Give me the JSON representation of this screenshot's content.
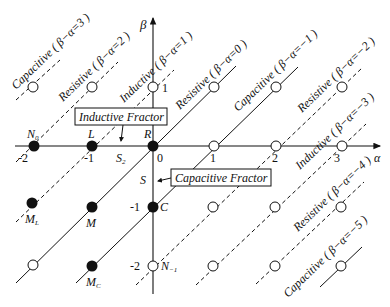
{
  "diagram": {
    "axes": {
      "x_label": "α",
      "y_label": "β",
      "x_ticks": [
        "-2",
        "-1",
        "0",
        "1",
        "2",
        "3"
      ],
      "y_ticks": [
        "1",
        "0",
        "-1",
        "-2"
      ]
    },
    "point_labels": {
      "N0": "N",
      "N0_sub": "0",
      "L": "L",
      "R": "R",
      "S2": "S",
      "S2_sub": "2",
      "S": "S",
      "C": "C",
      "ML": "M",
      "ML_sub": "L",
      "M": "M",
      "MC": "M",
      "MC_sub": "C",
      "Nm1": "N",
      "Nm1_sub": "−1"
    },
    "boxes": {
      "inductive": "Inductive Fractor",
      "capacitive": "Capacitive Fractor"
    },
    "line_labels": [
      {
        "text": "Capacitive ( β−α=3 )",
        "style": "dashed"
      },
      {
        "text": "Resistive ( β−α=2 )",
        "style": "dashed"
      },
      {
        "text": "Inductive ( β−α=1 )",
        "style": "dashed"
      },
      {
        "text": "Resistive ( β−α=0 )",
        "style": "solid"
      },
      {
        "text": "Capacitive ( β−α=−1 )",
        "style": "solid"
      },
      {
        "text": "Resistive ( β−α=−2 )",
        "style": "dashed"
      },
      {
        "text": "Inductive ( β−α=−3 )",
        "style": "dashed"
      },
      {
        "text": "Resistive ( β−α=−4 )",
        "style": "dashed"
      },
      {
        "text": "Capacitive ( β−α=−5 )",
        "style": "solid"
      }
    ],
    "filled_points": [
      {
        "name": "N0",
        "alpha": -2,
        "beta": 0
      },
      {
        "name": "L",
        "alpha": -1,
        "beta": 0
      },
      {
        "name": "R",
        "alpha": 0,
        "beta": 0
      },
      {
        "name": "ML",
        "alpha": -2,
        "beta": -1
      },
      {
        "name": "M",
        "alpha": -1,
        "beta": -1
      },
      {
        "name": "C",
        "alpha": 0,
        "beta": -1
      },
      {
        "name": "MC",
        "alpha": -1,
        "beta": -2
      }
    ],
    "open_points": [
      {
        "alpha": -2,
        "beta": 1
      },
      {
        "alpha": -1,
        "beta": 1
      },
      {
        "alpha": 0,
        "beta": 1
      },
      {
        "alpha": 1,
        "beta": 1
      },
      {
        "alpha": 2,
        "beta": 1
      },
      {
        "alpha": 3,
        "beta": 1
      },
      {
        "alpha": 1,
        "beta": 0
      },
      {
        "alpha": 2,
        "beta": 0
      },
      {
        "alpha": 3,
        "beta": 0
      },
      {
        "alpha": 1,
        "beta": -1
      },
      {
        "alpha": 2,
        "beta": -1
      },
      {
        "alpha": 3,
        "beta": -1
      },
      {
        "alpha": -2,
        "beta": -2
      },
      {
        "alpha": 0,
        "beta": -2,
        "name": "N-1"
      },
      {
        "alpha": 1,
        "beta": -2
      },
      {
        "alpha": 2,
        "beta": -2
      },
      {
        "alpha": 3,
        "beta": -2
      }
    ],
    "colors": {
      "ink": "#111111",
      "background": "#ffffff"
    }
  }
}
